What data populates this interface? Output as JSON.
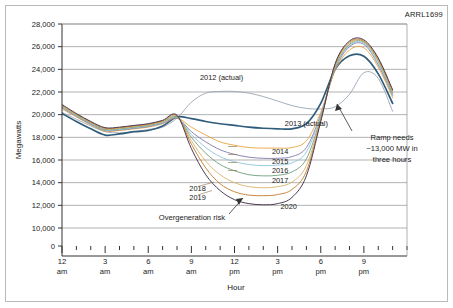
{
  "figure": {
    "corner_id": "ARRL1699",
    "background_color": "#ffffff",
    "border_color": "#b9b9b9"
  },
  "chart_data": {
    "type": "line",
    "title": "",
    "subtitle": "",
    "xlabel": "Hour",
    "ylabel": "Megawatts",
    "xlim": [
      0,
      24
    ],
    "ylim": [
      0,
      28000
    ],
    "yticks": [
      0,
      10000,
      12000,
      14000,
      16000,
      18000,
      20000,
      22000,
      24000,
      26000,
      28000
    ],
    "ytick_labels": [
      "0",
      "10,000",
      "12,000",
      "14,000",
      "16,000",
      "18,000",
      "20,000",
      "22,000",
      "24,000",
      "26,000",
      "28,000"
    ],
    "y_axis_break_after": "0",
    "xticks": [
      0,
      3,
      6,
      9,
      12,
      15,
      18,
      21
    ],
    "xtick_labels": [
      "12\nam",
      "3\nam",
      "6\nam",
      "9\nam",
      "12\npm",
      "3\npm",
      "6\npm",
      "9\npm"
    ],
    "xtick_label_lines": [
      [
        "12",
        "am"
      ],
      [
        "3",
        "am"
      ],
      [
        "6",
        "am"
      ],
      [
        "9",
        "am"
      ],
      [
        "12",
        "pm"
      ],
      [
        "3",
        "pm"
      ],
      [
        "6",
        "pm"
      ],
      [
        "9",
        "pm"
      ]
    ],
    "minor_xtick_interval": 1,
    "grid": "horizontal",
    "grid_color": "#909090",
    "legend_position": "inline-labels",
    "x": [
      0,
      1,
      2,
      3,
      4,
      5,
      6,
      7,
      8,
      9,
      10,
      11,
      12,
      13,
      14,
      15,
      16,
      17,
      18,
      19,
      20,
      21,
      22,
      23
    ],
    "series": [
      {
        "name": "2012 (actual)",
        "label": "2012 (actual)",
        "color": "#9aa6b4",
        "width": 0.9,
        "values": [
          20200,
          19600,
          19000,
          18500,
          18400,
          18500,
          18700,
          18900,
          19700,
          21100,
          21900,
          22050,
          22050,
          21900,
          21600,
          21200,
          20800,
          20550,
          20500,
          20700,
          21800,
          23700,
          23200,
          20300
        ]
      },
      {
        "name": "2013 (actual)",
        "label": "2013 (actual)",
        "color": "#2e5c7a",
        "width": 1.7,
        "values": [
          20100,
          19400,
          18750,
          18200,
          18300,
          18500,
          18600,
          19000,
          19800,
          19650,
          19400,
          19200,
          19050,
          18900,
          18800,
          18750,
          18750,
          19200,
          21000,
          24000,
          25200,
          25150,
          23600,
          21000
        ]
      },
      {
        "name": "2014",
        "label": "2014",
        "color": "#e8a33d",
        "width": 0.9,
        "values": [
          20500,
          19800,
          19100,
          18550,
          18600,
          18750,
          18900,
          19200,
          19700,
          18900,
          18200,
          17600,
          17300,
          17100,
          17050,
          17050,
          17100,
          17700,
          20200,
          23900,
          25700,
          25900,
          24200,
          21500
        ]
      },
      {
        "name": "2015",
        "label": "2015",
        "color": "#7e7ba8",
        "width": 0.9,
        "values": [
          20600,
          19850,
          19150,
          18600,
          18650,
          18800,
          18950,
          19250,
          19700,
          18500,
          17600,
          16900,
          16500,
          16250,
          16150,
          16150,
          16300,
          17100,
          20000,
          24000,
          26000,
          26200,
          24400,
          21700
        ]
      },
      {
        "name": "2016",
        "label": "2016",
        "color": "#8fc3da",
        "width": 0.9,
        "values": [
          20650,
          19900,
          19200,
          18650,
          18700,
          18850,
          19000,
          19300,
          19750,
          18250,
          17100,
          16300,
          15850,
          15600,
          15500,
          15550,
          15750,
          16700,
          19900,
          24100,
          26100,
          26300,
          24500,
          21800
        ]
      },
      {
        "name": "2017",
        "label": "2017",
        "color": "#6f9e7c",
        "width": 0.9,
        "values": [
          20700,
          19950,
          19250,
          18700,
          18750,
          18900,
          19050,
          19350,
          19800,
          18000,
          16600,
          15600,
          15050,
          14700,
          14600,
          14650,
          14950,
          16100,
          19700,
          24200,
          26200,
          26400,
          24700,
          21900
        ]
      },
      {
        "name": "2018",
        "label": "2018",
        "color": "#d9b26a",
        "width": 0.9,
        "values": [
          20750,
          20000,
          19300,
          18750,
          18800,
          18950,
          19100,
          19400,
          19850,
          17700,
          15900,
          14700,
          14000,
          13650,
          13550,
          13650,
          14050,
          15500,
          19600,
          24300,
          26300,
          26450,
          24800,
          22000
        ]
      },
      {
        "name": "2019",
        "label": "2019",
        "color": "#c07a2a",
        "width": 0.9,
        "values": [
          20800,
          20050,
          19350,
          18800,
          18850,
          19000,
          19150,
          19450,
          19900,
          17400,
          15300,
          13900,
          13200,
          12900,
          12850,
          12950,
          13400,
          15000,
          19500,
          24400,
          26400,
          26500,
          24900,
          22100
        ]
      },
      {
        "name": "2020",
        "label": "2020",
        "color": "#4a3b55",
        "width": 1.0,
        "values": [
          20900,
          20100,
          19400,
          18850,
          18900,
          19050,
          19200,
          19500,
          19950,
          17000,
          14700,
          13300,
          12500,
          12150,
          12050,
          12150,
          12700,
          14600,
          19400,
          24500,
          26500,
          26600,
          25000,
          22200
        ]
      }
    ],
    "annotations": [
      {
        "id": "ramp-needs",
        "text_lines": [
          "Ramp needs",
          "~13,000 MW in",
          "three hours"
        ],
        "text": "Ramp needs ~13,000 MW in three hours",
        "has_arrow": true
      },
      {
        "id": "overgeneration-risk",
        "text_lines": [
          "Overgeneration risk"
        ],
        "text": "Overgeneration risk",
        "has_arrow": true
      }
    ],
    "inline_series_labels": [
      {
        "name": "2012 (actual)",
        "at_hour": 9.6,
        "at_value": 23300
      },
      {
        "name": "2013 (actual)",
        "at_hour": 15.5,
        "at_value": 19300
      },
      {
        "name": "2014",
        "at_hour": 14.6,
        "at_value": 16800
      },
      {
        "name": "2015",
        "at_hour": 14.6,
        "at_value": 15950
      },
      {
        "name": "2016",
        "at_hour": 14.6,
        "at_value": 15100
      },
      {
        "name": "2017",
        "at_hour": 14.6,
        "at_value": 14250
      },
      {
        "name": "2018",
        "at_hour": 10.0,
        "at_value": 13500
      },
      {
        "name": "2019",
        "at_hour": 10.0,
        "at_value": 12700
      },
      {
        "name": "2020",
        "at_hour": 15.2,
        "at_value": 11900
      }
    ]
  }
}
